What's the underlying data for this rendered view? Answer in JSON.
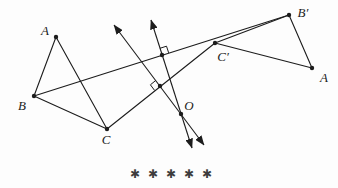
{
  "figure": {
    "width": 338,
    "height": 188,
    "background": "#fdfdfd",
    "ink_color": "#1c1c1c",
    "line_width": 1.1,
    "dot_radius": 2.2,
    "points": [
      {
        "id": "A",
        "label": "A",
        "x": 56,
        "y": 37,
        "lx": 45,
        "ly": 35,
        "name": "vertex-A"
      },
      {
        "id": "B",
        "label": "B",
        "x": 34,
        "y": 96,
        "lx": 22,
        "ly": 110,
        "name": "vertex-B"
      },
      {
        "id": "C",
        "label": "C",
        "x": 107,
        "y": 129,
        "lx": 106,
        "ly": 144,
        "name": "vertex-C"
      },
      {
        "id": "Bp",
        "label": "B′",
        "x": 289,
        "y": 15,
        "lx": 303,
        "ly": 17,
        "name": "vertex-B-prime"
      },
      {
        "id": "Cp",
        "label": "C′",
        "x": 215,
        "y": 43,
        "lx": 223,
        "ly": 61,
        "name": "vertex-C-prime"
      },
      {
        "id": "A2",
        "label": "A",
        "x": 312,
        "y": 68,
        "lx": 324,
        "ly": 82,
        "name": "vertex-A-right"
      },
      {
        "id": "O",
        "label": "O",
        "x": 181,
        "y": 114,
        "lx": 189,
        "ly": 110,
        "name": "point-O"
      },
      {
        "id": "M1",
        "label": "",
        "x": 162,
        "y": 55,
        "name": "midpoint-of-BB-prime"
      },
      {
        "id": "M2",
        "label": "",
        "x": 160,
        "y": 86,
        "name": "midpoint-of-CC-prime"
      }
    ],
    "segments": [
      {
        "from": "A",
        "to": "B",
        "name": "edge-A-B"
      },
      {
        "from": "B",
        "to": "C",
        "name": "edge-B-C"
      },
      {
        "from": "C",
        "to": "A",
        "name": "edge-C-A"
      },
      {
        "from": "Bp",
        "to": "Cp",
        "name": "edge-Bprime-Cprime"
      },
      {
        "from": "Cp",
        "to": "A2",
        "name": "edge-Cprime-A"
      },
      {
        "from": "A2",
        "to": "Bp",
        "name": "edge-A-Bprime"
      },
      {
        "from": "B",
        "to": "Bp",
        "name": "segment-B-Bprime"
      },
      {
        "from": "C",
        "to": "Cp",
        "name": "segment-C-Cprime"
      }
    ],
    "arrow_lines": [
      {
        "name": "perpendicular-bisector-of-BBprime",
        "x1": 151,
        "y1": 20,
        "x2": 192,
        "y2": 148
      },
      {
        "name": "perpendicular-bisector-of-CCprime",
        "x1": 114,
        "y1": 25,
        "x2": 204,
        "y2": 145
      }
    ],
    "right_angle_marks": [
      {
        "name": "right-angle-mark-on-BBprime",
        "points": "168.7,52.9 166.5,46.2 159.9,48.3"
      },
      {
        "name": "right-angle-mark-on-CCprime",
        "points": "155.8,80.4 150.4,84.8 154.6,90.4"
      }
    ],
    "asterisks": {
      "symbol": "✱",
      "count": 5,
      "x_start": 135,
      "spacing": 18,
      "baseline_y": 178,
      "color": "#3d3d3d"
    }
  }
}
